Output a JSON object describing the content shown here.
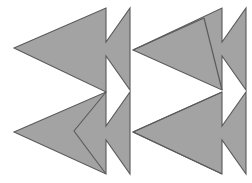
{
  "figure": {
    "title": "Arrow tessellation optical illusion",
    "canvas": {
      "width": 252,
      "height": 183,
      "background_color": "#ffffff"
    },
    "style": {
      "fill_color": "#a3a3a3",
      "outline_color": "#5a5a5a",
      "outline_width": 1.1
    },
    "shapes": [
      {
        "id": "arrow-top-left",
        "name": "top-left-arrow",
        "direction": "left",
        "points": "14,48 106,8 106,42 130,8 130,48 130,90 106,56 106,92",
        "dividers": []
      },
      {
        "id": "arrow-top-right",
        "name": "top-right-arrow",
        "direction": "left",
        "points": "133,50 222,8 222,42 246,8 246,48 246,90 222,56 222,90",
        "dividers": [
          "M 133,50 L 204,18",
          "M 204,18 L 222,90"
        ]
      },
      {
        "id": "arrow-bottom-left",
        "name": "bottom-left-arrow",
        "direction": "left",
        "points": "14,132 106,92 106,126 130,92 130,132 130,174 106,140 106,174",
        "dividers": [
          "M 106,92 L 74,131 L 106,174"
        ]
      },
      {
        "id": "arrow-bottom-right",
        "name": "bottom-right-arrow",
        "direction": "left",
        "points": "133,132 222,92 222,126 246,92 246,132 246,174 222,140 222,174",
        "dividers": [
          "M 133,132 L 222,92",
          "M 133,132 L 222,174"
        ]
      }
    ],
    "negative_space": {
      "name": "white-right-arrows",
      "count": 2,
      "direction": "right",
      "note": "White arrow shapes formed between the gray shapes, pointing right"
    }
  }
}
